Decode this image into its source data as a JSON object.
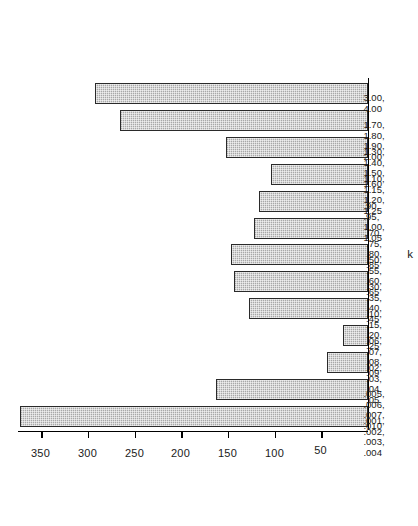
{
  "chart_data": {
    "type": "bar",
    "title": "",
    "orientation": "horizontal-rotated",
    "xlabel": "k",
    "ylabel": "Number of Students",
    "ylim": [
      0,
      375
    ],
    "grid": false,
    "legend": null,
    "value_ticks": [
      50,
      100,
      150,
      200,
      250,
      300,
      350
    ],
    "categories": [
      ".001, .002, .003, .004",
      ".005, .006, .007, .010",
      ".02, .03, .04, .05",
      ".06, .07, .08, .09",
      ".10, .15, .20, .25",
      ".30, .35, .40, .45",
      ".50, .55, .60, .65",
      ".70, .75, .80, .85",
      ".90, .95, 1.00, 1.05",
      "1.10, 1.15, 1.20, 1.25",
      "1.30, 1.40, 1.50, 1.60",
      "1.70, 1.80, 1.90, 2.00",
      "3.00, 4.00"
    ],
    "category_lines": [
      [
        ".001,",
        ".002,",
        ".003,",
        ".004"
      ],
      [
        ".005,",
        ".006,",
        ".007,",
        ".010"
      ],
      [
        ".02,",
        ".03,",
        ".04,",
        ".05"
      ],
      [
        ".06,",
        ".07,",
        ".08,",
        ".09"
      ],
      [
        ".10,",
        ".15,",
        ".20,",
        ".25"
      ],
      [
        ".30,",
        ".35,",
        ".40,",
        ".45"
      ],
      [
        ".50,",
        ".55,",
        ".60,",
        ".65"
      ],
      [
        ".70,",
        ".75,",
        ".80,",
        ".85"
      ],
      [
        ".90,",
        ".95,",
        "1.00,",
        "1.05"
      ],
      [
        "1.10,",
        "1.15,",
        "1.20,",
        "1.25"
      ],
      [
        "1.30,",
        "1.40,",
        "1.50,",
        "1.60"
      ],
      [
        "1.70,",
        "1.80,",
        "1.90,",
        "2.00"
      ],
      [
        "3.00,",
        "4.00"
      ]
    ],
    "values": [
      373,
      163,
      44,
      27,
      128,
      144,
      147,
      122,
      117,
      104,
      152,
      266,
      293
    ],
    "bar_fill": "#a8a8a8",
    "bar_edge": "#2a2a2a",
    "background": "#ffffff"
  }
}
